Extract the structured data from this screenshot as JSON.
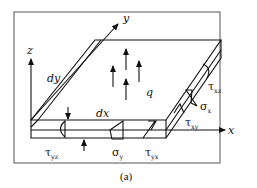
{
  "figure": {
    "caption": "(a)",
    "axes": {
      "x": "x",
      "y": "y",
      "z": "z"
    },
    "dimensions": {
      "dx": "dx",
      "dy": "dy",
      "thickness": "t"
    },
    "load": "q",
    "stresses": {
      "tau_yz": {
        "sym": "τ",
        "sub": "yz"
      },
      "sigma_y": {
        "sym": "σ",
        "sub": "y"
      },
      "tau_yx": {
        "sym": "τ",
        "sub": "yx"
      },
      "tau_xz": {
        "sym": "τ",
        "sub": "xz"
      },
      "sigma_x": {
        "sym": "σ",
        "sub": "x"
      },
      "tau_xy": {
        "sym": "τ",
        "sub": "xy"
      }
    }
  }
}
